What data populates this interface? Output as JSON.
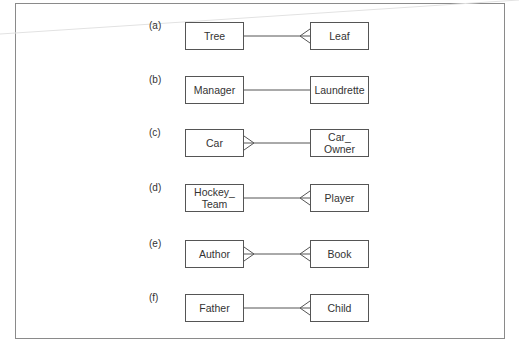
{
  "diagram": {
    "type": "ER relationship examples",
    "rows": [
      {
        "label": "(a)",
        "left": "Tree",
        "right": "Leaf",
        "left_end": "one",
        "right_end": "many"
      },
      {
        "label": "(b)",
        "left": "Manager",
        "right": "Laundrette",
        "left_end": "one",
        "right_end": "one"
      },
      {
        "label": "(c)",
        "left": "Car",
        "right": "Car_\nOwner",
        "left_end": "many",
        "right_end": "one"
      },
      {
        "label": "(d)",
        "left": "Hockey_\nTeam",
        "right": "Player",
        "left_end": "one",
        "right_end": "many"
      },
      {
        "label": "(e)",
        "left": "Author",
        "right": "Book",
        "left_end": "many",
        "right_end": "many"
      },
      {
        "label": "(f)",
        "left": "Father",
        "right": "Child",
        "left_end": "one",
        "right_end": "many"
      }
    ]
  },
  "colors": {
    "line": "#555555",
    "frame": "#8a8a8a",
    "text": "#333333"
  }
}
